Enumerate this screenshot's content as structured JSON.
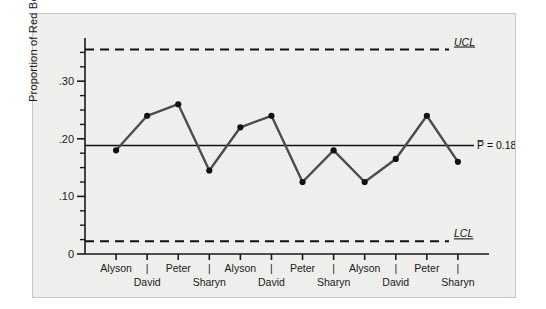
{
  "chart_data": {
    "type": "line",
    "title": "",
    "subtitle": "",
    "xlabel": "",
    "ylabel": "Proportion of Red Beads",
    "ylim": [
      0,
      0.375
    ],
    "ytick_values": [
      0,
      0.1,
      0.2,
      0.3
    ],
    "ytick_labels": [
      "0",
      ".10",
      ".20",
      ".30"
    ],
    "yminor_step": 0.025,
    "grid": false,
    "legend": "none",
    "x": [
      1,
      2,
      3,
      4,
      5,
      6,
      7,
      8,
      9,
      10,
      11,
      12
    ],
    "categories": [
      "Alyson",
      "David",
      "Peter",
      "Sharyn",
      "Alyson",
      "David",
      "Peter",
      "Sharyn",
      "Alyson",
      "David",
      "Peter",
      "Sharyn"
    ],
    "values": [
      0.18,
      0.24,
      0.26,
      0.145,
      0.22,
      0.24,
      0.125,
      0.18,
      0.125,
      0.165,
      0.24,
      0.16
    ],
    "series": [
      {
        "name": "Proportion of Red Beads",
        "values": [
          0.18,
          0.24,
          0.26,
          0.145,
          0.22,
          0.24,
          0.125,
          0.18,
          0.125,
          0.165,
          0.24,
          0.16
        ],
        "color": "#4d4d4d",
        "marker_color": "#111111"
      }
    ],
    "control_limits": {
      "ucl": {
        "value": 0.355,
        "label": "UCL",
        "style": "dashed"
      },
      "center": {
        "value": 0.1883,
        "label": "P̅ = 0.1883",
        "style": "solid"
      },
      "lcl": {
        "value": 0.022,
        "label": "LCL",
        "style": "dashed"
      }
    },
    "annotations": [
      {
        "text": "UCL",
        "target": "ucl-line"
      },
      {
        "text": "P̅ = 0.1883",
        "target": "center-line"
      },
      {
        "text": "LCL",
        "target": "lcl-line"
      }
    ],
    "axis_tick_separator": "|"
  },
  "axes": {
    "y_label": "Proportion of Red Beads",
    "y_ticks": [
      {
        "label": ".30",
        "value": 0.3
      },
      {
        "label": ".20",
        "value": 0.2
      },
      {
        "label": ".10",
        "value": 0.1
      },
      {
        "label": "0",
        "value": 0
      }
    ],
    "x_row_top": [
      "Alyson",
      "Peter",
      "Alyson",
      "Peter",
      "Alyson",
      "Peter"
    ],
    "x_row_bottom": [
      "David",
      "Sharyn",
      "David",
      "Sharyn",
      "David",
      "Sharyn"
    ],
    "x_separator": "|"
  },
  "labels": {
    "ucl": "UCL",
    "lcl": "LCL",
    "center": "P̅ = 0.1883"
  },
  "colors": {
    "panel_background": "#f0f0ee",
    "panel_border": "#c8c8c4",
    "page_background": "#ffffff",
    "axis": "#1a1a1a",
    "series_line": "#4d4d4d",
    "marker": "#111111",
    "limit_line": "#111111",
    "center_line": "#111111",
    "text": "#1a1a1a"
  }
}
